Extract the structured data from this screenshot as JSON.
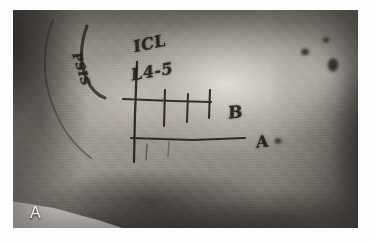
{
  "figure": {
    "panel_label": "A",
    "modality": "clinical photograph",
    "view": "posterior lower back and buttock",
    "tone": "grayscale"
  },
  "annotations": {
    "skin_markings": [
      {
        "id": "icl",
        "text": "ICL",
        "meaning": "intercristal line",
        "x": 120,
        "y": 24,
        "rotation": -12
      },
      {
        "id": "l45",
        "text": "L4-5",
        "meaning": "L4-5 interspace level",
        "x": 118,
        "y": 52,
        "rotation": -9
      },
      {
        "id": "psis",
        "text": "PSIS",
        "meaning": "posterior superior iliac spine",
        "x": 70,
        "y": 42,
        "rotation": 72
      },
      {
        "id": "pt-b",
        "text": "B",
        "meaning": "needle entry point B",
        "x": 215,
        "y": 92,
        "rotation": -4
      },
      {
        "id": "pt-a",
        "text": "A",
        "meaning": "needle entry point A",
        "x": 243,
        "y": 122,
        "rotation": -6
      }
    ],
    "landmark_lines": [
      {
        "id": "vertical-midline",
        "type": "vertical",
        "description": "long vertical marker line through L4-5"
      },
      {
        "id": "horizontal-upper",
        "type": "horizontal",
        "description": "upper horizontal line ending at point B"
      },
      {
        "id": "horizontal-lower",
        "type": "horizontal",
        "description": "lower horizontal line ending at point A"
      },
      {
        "id": "tick-1",
        "type": "tick",
        "description": "first short vertical tick"
      },
      {
        "id": "tick-2",
        "type": "tick",
        "description": "second short vertical tick"
      },
      {
        "id": "tick-3",
        "type": "tick",
        "description": "third short vertical tick at B"
      },
      {
        "id": "psis-arc",
        "type": "arc",
        "description": "curved line marking the PSIS / iliac crest"
      }
    ],
    "skin_lesions": [
      {
        "id": "nevus-1",
        "cx": 292,
        "cy": 42,
        "rx": 4.0,
        "ry": 3.2
      },
      {
        "id": "nevus-2",
        "cx": 313,
        "cy": 30,
        "rx": 3.2,
        "ry": 2.6
      },
      {
        "id": "nevus-3",
        "cx": 320,
        "cy": 55,
        "rx": 5.2,
        "ry": 6.4
      },
      {
        "id": "nevus-4",
        "cx": 265,
        "cy": 131,
        "rx": 3.6,
        "ry": 2.8
      }
    ]
  },
  "colors": {
    "marker_ink": "#231f1d",
    "panel_label": "#f2f0ec",
    "photo_border": "#ffffff",
    "skin_mid": "#9d9890",
    "shadow_deep": "#262421"
  }
}
